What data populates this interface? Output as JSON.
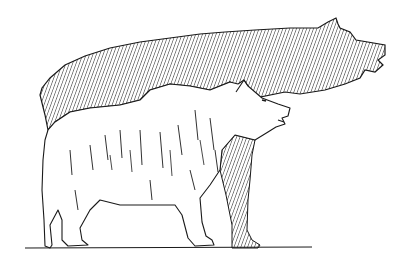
{
  "figure": {
    "elements": [
      {
        "name": "large-bear-silhouette",
        "style": "diagonal hatching"
      },
      {
        "name": "small-bear-sketch",
        "style": "line drawing"
      },
      {
        "name": "ground-line",
        "style": "line"
      }
    ],
    "colors": {
      "ink": "#1a1a1a",
      "background": "#ffffff"
    }
  }
}
